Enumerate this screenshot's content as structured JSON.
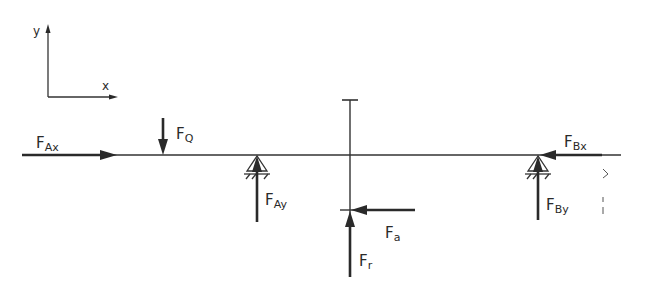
{
  "diagram": {
    "type": "free-body-diagram",
    "axes": {
      "x_label": "x",
      "y_label": "y"
    },
    "forces": [
      {
        "id": "F_Ax",
        "symbol": "F",
        "subscript": "Ax",
        "direction": "right",
        "location": "left end of shaft"
      },
      {
        "id": "F_Q",
        "symbol": "F",
        "subscript": "Q",
        "direction": "down",
        "location": "left overhang"
      },
      {
        "id": "F_Ay",
        "symbol": "F",
        "subscript": "Ay",
        "direction": "up",
        "location": "support A"
      },
      {
        "id": "F_a",
        "symbol": "F",
        "subscript": "a",
        "direction": "left",
        "location": "gear/pulley"
      },
      {
        "id": "F_r",
        "symbol": "F",
        "subscript": "r",
        "direction": "up",
        "location": "gear/pulley"
      },
      {
        "id": "F_Bx",
        "symbol": "F",
        "subscript": "Bx",
        "direction": "left",
        "location": "support B"
      },
      {
        "id": "F_By",
        "symbol": "F",
        "subscript": "By",
        "direction": "up",
        "location": "support B"
      }
    ],
    "supports": [
      {
        "id": "A",
        "type": "pin support"
      },
      {
        "id": "B",
        "type": "pin support"
      }
    ],
    "colors": {
      "ink": "#2a2a2a",
      "background": "#ffffff"
    }
  }
}
